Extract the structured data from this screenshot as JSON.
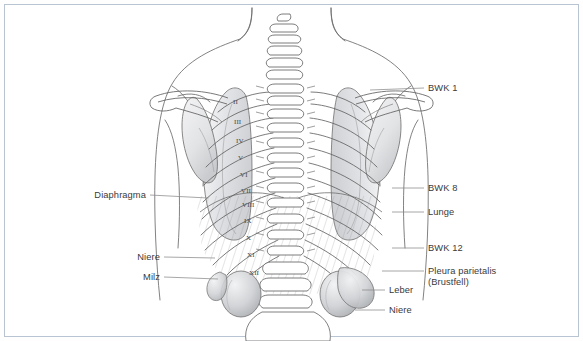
{
  "figure": {
    "border_color": "#b9c4d2",
    "background": "#ffffff",
    "text_color": "#3a3a3a",
    "leader_color": "#7d7d7d",
    "outline_color": "#555555",
    "organ_fill": "#d9dadc",
    "lung_fill": "#e6e7e9"
  },
  "labels": {
    "right": [
      {
        "id": "bwk-1",
        "text": "BWK 1",
        "x": 428,
        "y": 83,
        "leader": {
          "x1": 370,
          "y1": 90,
          "x2": 424,
          "y2": 88
        }
      },
      {
        "id": "bwk-8",
        "text": "BWK 8",
        "x": 428,
        "y": 183,
        "leader": {
          "x1": 392,
          "y1": 188,
          "x2": 424,
          "y2": 188
        }
      },
      {
        "id": "lunge",
        "text": "Lunge",
        "x": 428,
        "y": 207,
        "leader": {
          "x1": 392,
          "y1": 212,
          "x2": 424,
          "y2": 212
        }
      },
      {
        "id": "bwk-12",
        "text": "BWK 12",
        "x": 428,
        "y": 243,
        "leader": {
          "x1": 392,
          "y1": 248,
          "x2": 424,
          "y2": 248
        }
      },
      {
        "id": "pleura",
        "text": "Pleura parietalis",
        "text2": "(Brustfell)",
        "x": 428,
        "y": 266,
        "leader": {
          "x1": 382,
          "y1": 271,
          "x2": 424,
          "y2": 271
        }
      }
    ],
    "right_inner": [
      {
        "id": "leber",
        "text": "Leber",
        "x": 389,
        "y": 285,
        "leader": {
          "x1": 362,
          "y1": 290,
          "x2": 385,
          "y2": 290
        }
      },
      {
        "id": "niere-right",
        "text": "Niere",
        "x": 389,
        "y": 305,
        "leader": {
          "x1": 355,
          "y1": 310,
          "x2": 385,
          "y2": 310
        }
      }
    ],
    "left": [
      {
        "id": "diaphragma",
        "text": "Diaphragma",
        "x": 146,
        "y": 190,
        "leader": {
          "x1": 150,
          "y1": 195,
          "x2": 208,
          "y2": 198
        }
      },
      {
        "id": "niere-left",
        "text": "Niere",
        "x": 160,
        "y": 252,
        "leader": {
          "x1": 164,
          "y1": 257,
          "x2": 215,
          "y2": 258
        }
      },
      {
        "id": "milz",
        "text": "Milz",
        "x": 160,
        "y": 272,
        "leader": {
          "x1": 164,
          "y1": 277,
          "x2": 218,
          "y2": 279
        }
      }
    ]
  },
  "rib_numerals": [
    {
      "n": "II",
      "x": 233,
      "y": 97
    },
    {
      "n": "III",
      "x": 234,
      "y": 117
    },
    {
      "n": "IV",
      "x": 236,
      "y": 136
    },
    {
      "n": "V",
      "x": 238,
      "y": 153
    },
    {
      "n": "VI",
      "x": 240,
      "y": 170
    },
    {
      "n": "VII",
      "x": 241,
      "y": 186
    },
    {
      "n": "VIII",
      "x": 242,
      "y": 200
    },
    {
      "n": "IX",
      "x": 244,
      "y": 216
    },
    {
      "n": "X",
      "x": 246,
      "y": 233
    },
    {
      "n": "XI",
      "x": 247,
      "y": 250
    },
    {
      "n": "XII",
      "x": 249,
      "y": 268
    }
  ],
  "anatomy": {
    "regions": [
      "cervical-vertebrae",
      "thoracic-vertebrae",
      "lumbar-vertebrae",
      "clavicle-left",
      "clavicle-right",
      "scapula-left",
      "scapula-right",
      "ribcage",
      "lung-left",
      "lung-right",
      "diaphragm",
      "kidney-left",
      "kidney-right",
      "liver",
      "spleen",
      "torso-outline"
    ]
  }
}
